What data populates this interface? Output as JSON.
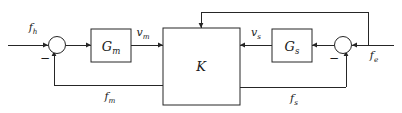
{
  "diagram": {
    "background_color": "#ffffff",
    "line_color": "#262626",
    "blocks": [
      {
        "id": "Gm",
        "label": "G",
        "sub": "m",
        "name": "master-dynamics-block"
      },
      {
        "id": "K",
        "label": "K",
        "sub": "",
        "name": "controller-block"
      },
      {
        "id": "Gs",
        "label": "G",
        "sub": "s",
        "name": "slave-dynamics-block"
      }
    ],
    "junctions": [
      {
        "id": "sum_left",
        "name": "left-summing-junction",
        "sign": "−"
      },
      {
        "id": "sum_right",
        "name": "right-summing-junction",
        "sign": "−"
      }
    ],
    "signals": [
      {
        "id": "fh",
        "label": "f",
        "sub": "h",
        "name": "human-force-input"
      },
      {
        "id": "vm",
        "label": "v",
        "sub": "m",
        "name": "master-velocity-signal"
      },
      {
        "id": "vs",
        "label": "v",
        "sub": "s",
        "name": "slave-velocity-signal"
      },
      {
        "id": "fe",
        "label": "f",
        "sub": "e",
        "name": "environment-force-input"
      },
      {
        "id": "fm",
        "label": "f",
        "sub": "m",
        "name": "master-force-feedback"
      },
      {
        "id": "fs",
        "label": "f",
        "sub": "s",
        "name": "slave-force-feedback"
      }
    ]
  }
}
